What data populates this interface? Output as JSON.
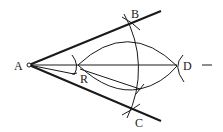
{
  "diagram": {
    "type": "geometric-construction",
    "points": {
      "A": {
        "label": "A",
        "x": 29,
        "y": 65
      },
      "B": {
        "label": "B",
        "x": 132,
        "y": 24
      },
      "C": {
        "label": "C",
        "x": 132,
        "y": 108
      },
      "D": {
        "label": "D",
        "x": 177,
        "y": 66
      },
      "R": {
        "label": "R",
        "x": 78,
        "y": 65
      }
    },
    "colors": {
      "stroke": "#1a1a1a",
      "background": "#ffffff"
    }
  }
}
